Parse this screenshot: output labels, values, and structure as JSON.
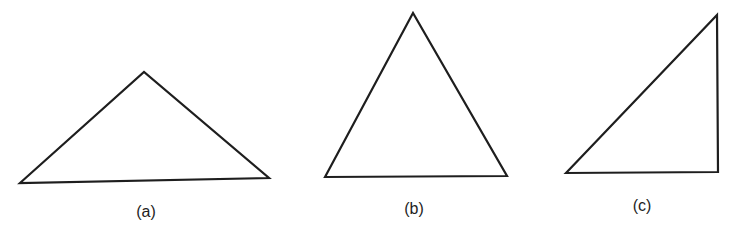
{
  "figure": {
    "background": "#ffffff",
    "stroke_color": "#1e1e1e",
    "panels": [
      {
        "id": "a",
        "label": "(a)",
        "shape": "obtuse-triangle",
        "points": "20,183 144,72 269,178",
        "label_x": 146,
        "label_y": 213
      },
      {
        "id": "b",
        "label": "(b)",
        "shape": "acute-triangle",
        "points": "325,177 413,13 507,176",
        "label_x": 414,
        "label_y": 210
      },
      {
        "id": "c",
        "label": "(c)",
        "shape": "right-triangle",
        "points": "566,173 717,15 718,172",
        "label_x": 642,
        "label_y": 207
      }
    ]
  }
}
